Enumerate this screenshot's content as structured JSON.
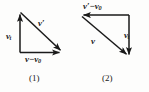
{
  "figure": {
    "background_color": "#fdfdfc",
    "stroke_color": "#1a1a1a",
    "text_color": "#1a1a1a"
  },
  "panels": [
    {
      "id": "1",
      "caption": "(1)",
      "labels": {
        "vertical": {
          "symbol": "v",
          "sub": "t",
          "prime": ""
        },
        "diagonal": {
          "symbol": "v",
          "sub": "",
          "prime": "′"
        },
        "horizontal": {
          "lead": "v",
          "op": "−",
          "trail": "v",
          "trail_sub": "0"
        }
      },
      "vectors": [
        {
          "name": "v_t",
          "from": [
            20,
            52
          ],
          "to": [
            20,
            12
          ],
          "direction": "up",
          "label": "v_t"
        },
        {
          "name": "v_prime",
          "from": [
            20,
            12
          ],
          "to": [
            63,
            52
          ],
          "direction": "down-right",
          "label": "v′"
        },
        {
          "name": "v_minus_v0",
          "from": [
            20,
            52
          ],
          "to": [
            63,
            52
          ],
          "direction": "right",
          "label": "v−v₀"
        }
      ]
    },
    {
      "id": "2",
      "caption": "(2)",
      "labels": {
        "horizontal": {
          "lead": "v",
          "lead_prime": "′",
          "op": "−",
          "trail": "v",
          "trail_sub": "0"
        },
        "diagonal": {
          "symbol": "v",
          "sub": "",
          "prime": ""
        },
        "vertical": {
          "symbol": "v",
          "sub": "t",
          "prime": ""
        }
      },
      "vectors": [
        {
          "name": "v_prime_minus_v0",
          "from": [
            57,
            15
          ],
          "to": [
            9,
            15
          ],
          "direction": "left",
          "label": "v′−v₀"
        },
        {
          "name": "v_t",
          "from": [
            57,
            15
          ],
          "to": [
            57,
            57
          ],
          "direction": "down",
          "label": "v_t"
        },
        {
          "name": "v",
          "from": [
            9,
            15
          ],
          "to": [
            57,
            57
          ],
          "direction": "down-right",
          "label": "v"
        }
      ]
    }
  ]
}
